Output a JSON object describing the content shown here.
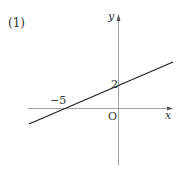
{
  "problem": {
    "number_label": "(1)"
  },
  "graph": {
    "x_axis_label": "x",
    "y_axis_label": "y",
    "origin_label": "O",
    "x_intercept_label": "−5",
    "y_intercept_label": "2",
    "line": {
      "x_intercept": -5,
      "y_intercept": 2,
      "slope": 0.4,
      "equation": "y = (2/5)x + 2"
    },
    "colors": {
      "axis": "#777777",
      "line": "#222222",
      "text": "#333333"
    }
  }
}
